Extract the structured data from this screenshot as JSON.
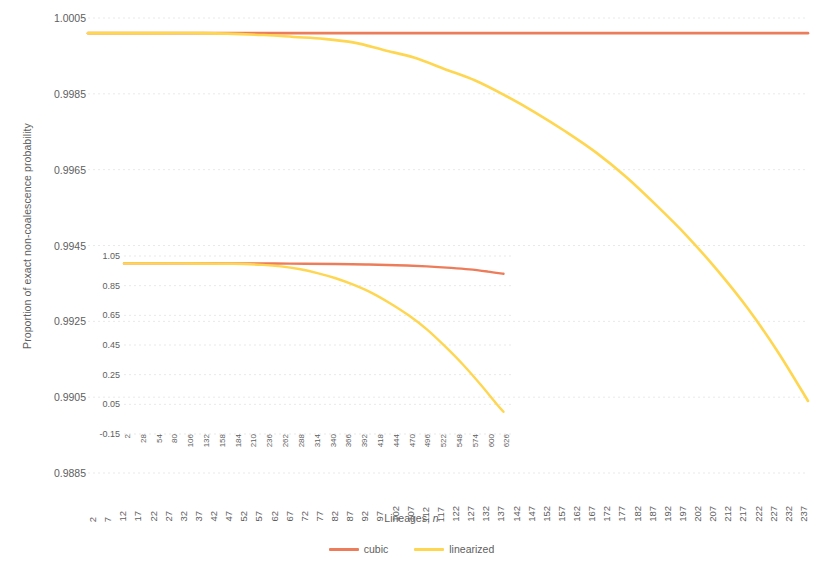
{
  "chart_data": {
    "type": "line",
    "title": "",
    "xlabel": "Lineages, n",
    "ylabel": "Proportion of exact non-coalescence probability",
    "grid": true,
    "legend_position": "bottom",
    "xlim": [
      2,
      240
    ],
    "ylim": [
      0.9885,
      1.0005
    ],
    "y_ticks": [
      "1.0005",
      "0.9985",
      "0.9965",
      "0.9945",
      "0.9925",
      "0.9905",
      "0.9885"
    ],
    "x_ticks": [
      "2",
      "7",
      "12",
      "17",
      "22",
      "27",
      "32",
      "37",
      "42",
      "47",
      "52",
      "57",
      "62",
      "67",
      "72",
      "77",
      "82",
      "87",
      "92",
      "97",
      "102",
      "107",
      "112",
      "117",
      "122",
      "127",
      "132",
      "137",
      "142",
      "147",
      "152",
      "157",
      "162",
      "167",
      "172",
      "177",
      "182",
      "187",
      "192",
      "197",
      "202",
      "207",
      "212",
      "217",
      "222",
      "227",
      "232",
      "237"
    ],
    "series": [
      {
        "name": "cubic",
        "color": "#ED7D5A",
        "x": [
          2,
          20,
          40,
          60,
          80,
          100,
          120,
          140,
          160,
          180,
          200,
          220,
          240
        ],
        "values": [
          1.0001,
          1.0001,
          1.0001,
          1.0001,
          1.0001,
          1.0001,
          1.0001,
          1.0001,
          1.0001,
          1.0001,
          1.0001,
          1.0001,
          1.0001
        ]
      },
      {
        "name": "linearized",
        "color": "#FFD64F",
        "x": [
          2,
          20,
          40,
          60,
          70,
          80,
          90,
          100,
          110,
          120,
          130,
          140,
          150,
          160,
          170,
          180,
          190,
          200,
          210,
          220,
          230,
          240
        ],
        "values": [
          1.0001,
          1.0001,
          1.0001,
          1.00005,
          1.0,
          0.99995,
          0.99985,
          0.99965,
          0.99945,
          0.99915,
          0.99885,
          0.99845,
          0.998,
          0.9975,
          0.99695,
          0.9963,
          0.99555,
          0.99475,
          0.99385,
          0.99285,
          0.9917,
          0.9904
        ]
      }
    ],
    "inset": {
      "type": "line",
      "xlim": [
        2,
        640
      ],
      "ylim": [
        -0.15,
        1.05
      ],
      "y_ticks": [
        "1.05",
        "0.85",
        "0.65",
        "0.45",
        "0.25",
        "0.05",
        "-0.15"
      ],
      "x_ticks": [
        "2",
        "28",
        "54",
        "80",
        "106",
        "132",
        "158",
        "184",
        "210",
        "236",
        "262",
        "288",
        "314",
        "340",
        "366",
        "392",
        "418",
        "444",
        "470",
        "496",
        "522",
        "548",
        "574",
        "600",
        "626"
      ],
      "series": [
        {
          "name": "cubic",
          "color": "#ED7D5A",
          "x": [
            2,
            100,
            200,
            250,
            300,
            350,
            400,
            450,
            500,
            540,
            570,
            600,
            626
          ],
          "values": [
            1.0,
            1.0,
            1.0,
            0.999,
            0.998,
            0.996,
            0.993,
            0.988,
            0.98,
            0.97,
            0.96,
            0.945,
            0.93
          ]
        },
        {
          "name": "linearized",
          "color": "#FFD64F",
          "x": [
            2,
            100,
            180,
            230,
            260,
            290,
            320,
            350,
            380,
            410,
            440,
            470,
            500,
            530,
            560,
            590,
            615,
            626
          ],
          "values": [
            1.0,
            1.0,
            0.998,
            0.99,
            0.98,
            0.962,
            0.935,
            0.9,
            0.855,
            0.8,
            0.73,
            0.65,
            0.555,
            0.44,
            0.315,
            0.175,
            0.05,
            0.0
          ]
        }
      ]
    },
    "legend": [
      {
        "label": "cubic",
        "color": "#ED7D5A"
      },
      {
        "label": "linearized",
        "color": "#FFD64F"
      }
    ]
  },
  "colors": {
    "cubic": "#ED7D5A",
    "linearized": "#FFD64F",
    "grid": "#E9E9E9",
    "text": "#5E5E5E",
    "background": "#FFFFFF"
  },
  "axis": {
    "x_title_main": "Lineages,",
    "x_title_italic": "n"
  }
}
